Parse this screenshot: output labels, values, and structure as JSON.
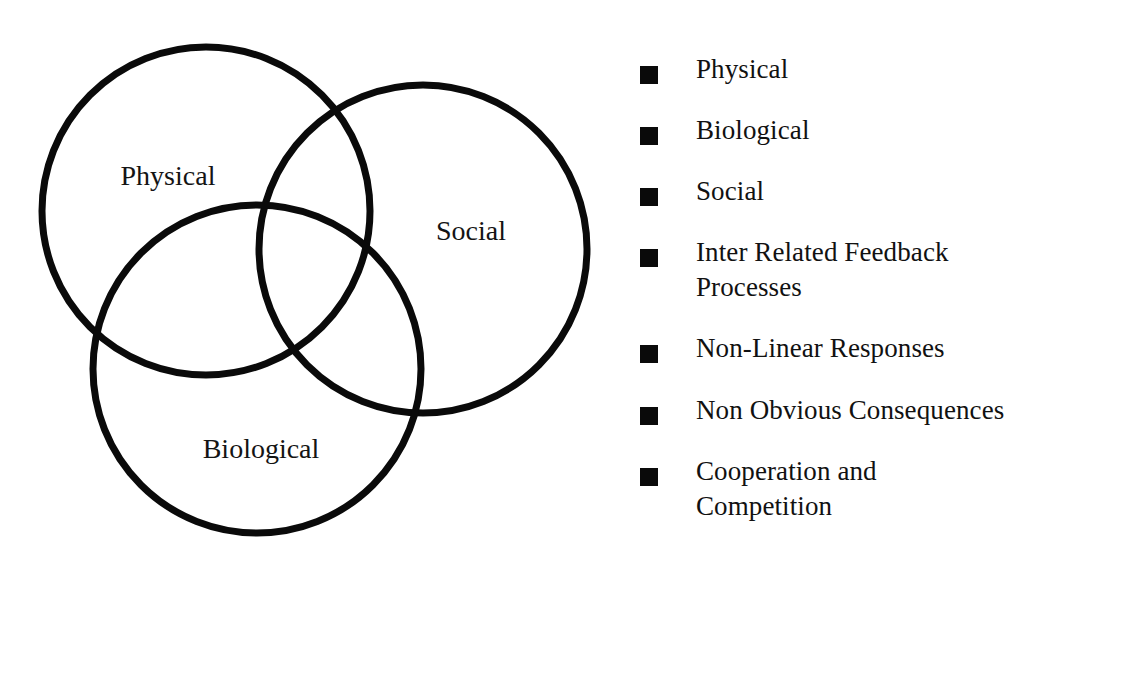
{
  "diagram": {
    "type": "venn",
    "title": "",
    "background_color": "#ffffff",
    "stroke_color": "#0a0a0a",
    "stroke_width": 7,
    "circles": [
      {
        "id": "physical",
        "label": "Physical",
        "cx": 206,
        "cy": 211,
        "r": 164,
        "label_x": 168,
        "label_y": 185
      },
      {
        "id": "social",
        "label": "Social",
        "cx": 423,
        "cy": 249,
        "r": 164,
        "label_x": 471,
        "label_y": 240
      },
      {
        "id": "biological",
        "label": "Biological",
        "cx": 257,
        "cy": 369,
        "r": 164,
        "label_x": 261,
        "label_y": 458
      }
    ],
    "labels": {
      "physical": "Physical",
      "social": "Social",
      "biological": "Biological"
    }
  },
  "bullet_list": {
    "marker_icon": "filled-square-bullet",
    "marker_color": "#0a0a0a",
    "items": [
      {
        "text": "Physical"
      },
      {
        "text": "Biological"
      },
      {
        "text": "Social"
      },
      {
        "text": "Inter Related Feedback\nProcesses"
      },
      {
        "text": "Non-Linear Responses"
      },
      {
        "text": "Non Obvious Consequences"
      },
      {
        "text": "Cooperation and\nCompetition"
      }
    ]
  }
}
